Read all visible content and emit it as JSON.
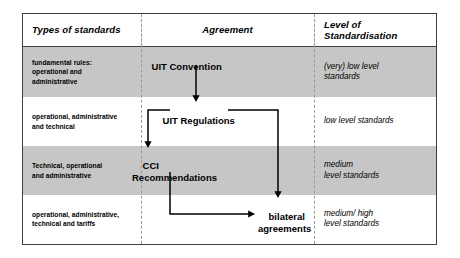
{
  "diagram": {
    "columns": [
      {
        "id": "types",
        "header": "Types of standards"
      },
      {
        "id": "agreement",
        "header": "Agreement"
      },
      {
        "id": "level",
        "header": "Level of\nStandardisation"
      }
    ],
    "rows": [
      {
        "shaded": true,
        "types": "fundamental rules:\noperational and\nadministrative",
        "level": "(very) low level\nstandards"
      },
      {
        "shaded": false,
        "types": "operational, administrative\nand technical",
        "level": "low level standards"
      },
      {
        "shaded": true,
        "types": "Technical, operational\nand administrative",
        "level": "medium\nlevel standards"
      },
      {
        "shaded": false,
        "types": "operational, administrative,\ntechnical and tariffs",
        "level": "medium/ high\nlevel standards"
      }
    ],
    "nodes": [
      {
        "id": "convention",
        "label": "UIT Convention"
      },
      {
        "id": "regulations",
        "label": "UIT Regulations"
      },
      {
        "id": "recommendations",
        "label": "CCI\nRecommendations"
      },
      {
        "id": "bilateral",
        "label": "bilateral\nagreements"
      }
    ],
    "edges": [
      {
        "from": "convention",
        "to": "regulations",
        "style": "arrow-down"
      },
      {
        "from": "regulations",
        "to": "recommendations",
        "style": "elbow-left-down-arrow"
      },
      {
        "from": "regulations",
        "to": "bilateral",
        "style": "elbow-right-down-arrow"
      },
      {
        "from": "recommendations",
        "to": "bilateral",
        "style": "elbow-down-right-arrow"
      }
    ],
    "colors": {
      "shaded_row": "#c6c6c6",
      "plain_row": "#ffffff",
      "border": "#404040",
      "separator": "#9a9a9a",
      "text": "#000000"
    }
  }
}
